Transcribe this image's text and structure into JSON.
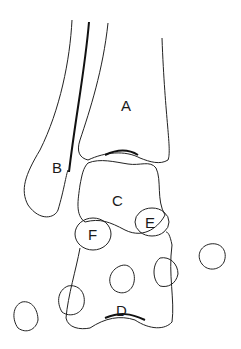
{
  "diagram": {
    "type": "anatomical line drawing",
    "labels": [
      {
        "id": "A",
        "text": "A",
        "x": 127,
        "y": 111
      },
      {
        "id": "B",
        "text": "B",
        "x": 58,
        "y": 171
      },
      {
        "id": "C",
        "text": "C",
        "x": 118,
        "y": 206
      },
      {
        "id": "E",
        "text": "E",
        "x": 150,
        "y": 231
      },
      {
        "id": "F",
        "text": "F",
        "x": 93,
        "y": 240
      },
      {
        "id": "D",
        "text": "D",
        "x": 122,
        "y": 319
      }
    ],
    "colors": {
      "line": "#222222",
      "background": "#ffffff"
    }
  }
}
